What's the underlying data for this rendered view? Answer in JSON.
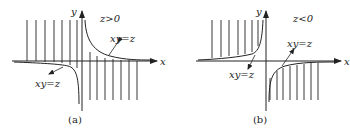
{
  "panels": [
    {
      "id": "a",
      "caption": "(a)",
      "condition": "z>0",
      "x_axis_label": "x",
      "y_axis_label": "y",
      "curve_labels": [
        "xy=z",
        "xy=z"
      ],
      "description": "Hyperbola xy=z with z>0: branches in quadrants I and III; vertical hatch lines above x-axis for x<0 and below for x>0"
    },
    {
      "id": "b",
      "caption": "(b)",
      "condition": "z<0",
      "x_axis_label": "x",
      "y_axis_label": "y",
      "curve_labels": [
        "xy=z",
        "xy=z"
      ],
      "description": "Hyperbola xy=z with z<0: branches in quadrants II and IV; vertical hatch lines above x-axis for x<0 and below for x>0"
    }
  ],
  "colors": {
    "ink": "#222222",
    "background": "#ffffff"
  }
}
